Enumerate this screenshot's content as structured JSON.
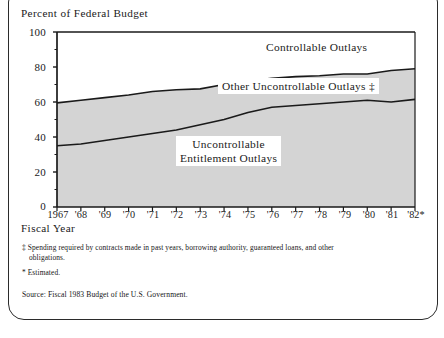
{
  "figure": {
    "frame_border_color": "#2b2b2b",
    "background": "#ffffff"
  },
  "chart_data": {
    "type": "area",
    "stacked": true,
    "title": "",
    "ylabel": "Percent of Federal Budget",
    "xlabel": "Fiscal Year",
    "ylim": [
      0,
      100
    ],
    "yticks": [
      0,
      20,
      40,
      60,
      80,
      100
    ],
    "ytick_labels": [
      "0",
      "20",
      "40",
      "60",
      "80",
      "100"
    ],
    "grid": false,
    "legend_position": "inline-annotations",
    "x": [
      1967,
      1968,
      1969,
      1970,
      1971,
      1972,
      1973,
      1974,
      1975,
      1976,
      1977,
      1978,
      1979,
      1980,
      1981,
      1982
    ],
    "categories": [
      "1967",
      "'68",
      "'69",
      "'70",
      "'71",
      "'72",
      "'73",
      "'74",
      "'75",
      "'76",
      "'77",
      "'78",
      "'79",
      "'80",
      "'81",
      "'82*"
    ],
    "boundaries": {
      "uncontrollable_entitlement_top": [
        35,
        36,
        38,
        40,
        42,
        44,
        47,
        50,
        54,
        57,
        58,
        59,
        60,
        61,
        60,
        61.5
      ],
      "other_uncontrollable_top": [
        59.5,
        61,
        62.5,
        64,
        66,
        67,
        67.5,
        70,
        72,
        73.5,
        74.5,
        75,
        76,
        76,
        78,
        79
      ]
    },
    "series": [
      {
        "name": "Uncontrollable Entitlement Outlays",
        "fill": "#d4d4d4",
        "values": [
          35,
          36,
          38,
          40,
          42,
          44,
          47,
          50,
          54,
          57,
          58,
          59,
          60,
          61,
          60,
          61.5
        ]
      },
      {
        "name": "Other Uncontrollable Outlays ‡",
        "fill": "#d4d4d4",
        "values": [
          24.5,
          25,
          24.5,
          24,
          24,
          23,
          20.5,
          20,
          18,
          16.5,
          16.5,
          16,
          16,
          15,
          18,
          17.5
        ]
      },
      {
        "name": "Controllable Outlays",
        "fill": "#ffffff",
        "values": [
          40.5,
          39,
          37.5,
          36,
          34,
          33,
          32.5,
          30,
          28,
          26.5,
          25.5,
          25,
          24,
          24,
          22,
          21
        ]
      }
    ],
    "annotations": [
      {
        "id": "controllable",
        "text": "Controllable Outlays",
        "boxed": false
      },
      {
        "id": "other_uncontrollable",
        "text": "Other Uncontrollable Outlays ‡",
        "boxed": true
      },
      {
        "id": "entitlement",
        "line1": "Uncontrollable",
        "line2": "Entitlement Outlays",
        "boxed": true
      }
    ]
  },
  "footnotes": {
    "dagger": "‡ Spending required by contracts made in past years, borrowing authority, guaranteed loans, and other",
    "dagger_cont": "obligations.",
    "estimated": "* Estimated.",
    "source": "Source: Fiscal 1983 Budget of the U.S. Government."
  }
}
